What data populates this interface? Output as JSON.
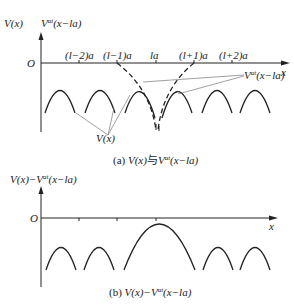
{
  "panel_a": {
    "y_label_1": "V(x)",
    "y_label_2": "V",
    "y_label_2_sup": "at",
    "y_label_2_arg": "(x−la)",
    "origin": "O",
    "x_axis": "x",
    "ticks": [
      "(l−2)a",
      "(l−1)a",
      "la",
      "(l+1)a",
      "(l+2)a"
    ],
    "annot_v_at": "V",
    "annot_v_at_sup": "at",
    "annot_v_at_arg": "(x−la)",
    "annot_v": "V(x)",
    "caption_prefix": "(a) ",
    "caption_1": "V(x)",
    "caption_mid": "与",
    "caption_2": "V",
    "caption_sup": "at",
    "caption_arg": "(x−la)"
  },
  "panel_b": {
    "y_label": "V(x)−V",
    "y_label_sup": "at",
    "y_label_arg": "(x−la)",
    "origin": "O",
    "x_axis": "x",
    "caption_prefix": "(b) ",
    "caption_1": "V(x)−V",
    "caption_sup": "at",
    "caption_arg": "(x−la)"
  },
  "colors": {
    "line": "#222222",
    "pointer": "#777777"
  }
}
